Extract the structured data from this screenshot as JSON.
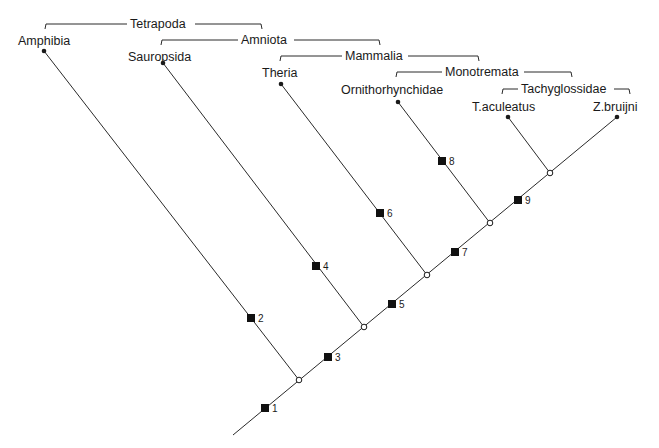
{
  "diagram": {
    "type": "cladogram",
    "taxa": [
      {
        "label": "Amphibia",
        "x": 44,
        "y": 51,
        "lx": 18,
        "ly": 45
      },
      {
        "label": "Sauropsida",
        "x": 163,
        "y": 63,
        "lx": 128,
        "ly": 61
      },
      {
        "label": "Theria",
        "x": 281,
        "y": 84,
        "lx": 262,
        "ly": 77
      },
      {
        "label": "Ornithorhynchidae",
        "x": 398,
        "y": 102,
        "lx": 341,
        "ly": 94
      },
      {
        "label": "T.aculeatus",
        "x": 508,
        "y": 117,
        "lx": 472,
        "ly": 111
      },
      {
        "label": "Z.bruijni",
        "x": 617,
        "y": 117,
        "lx": 593,
        "ly": 111
      }
    ],
    "clades": [
      {
        "label": "Tetrapoda",
        "x1": 45,
        "x2": 262,
        "y": 24,
        "lx": 130,
        "lw": 62
      },
      {
        "label": "Amniota",
        "x1": 161,
        "x2": 380,
        "y": 40,
        "lx": 241,
        "lw": 50
      },
      {
        "label": "Mammalia",
        "x1": 280,
        "x2": 479,
        "y": 56,
        "lx": 345,
        "lw": 60
      },
      {
        "label": "Monotremata",
        "x1": 396,
        "x2": 572,
        "y": 72,
        "lx": 445,
        "lw": 76
      },
      {
        "label": "Tachyglossidae",
        "x1": 502,
        "x2": 630,
        "y": 89,
        "lx": 521,
        "lw": 90
      }
    ],
    "nodes": [
      {
        "x": 299,
        "y": 380
      },
      {
        "x": 364,
        "y": 327
      },
      {
        "x": 427,
        "y": 275
      },
      {
        "x": 490,
        "y": 223
      },
      {
        "x": 550,
        "y": 173
      }
    ],
    "root": {
      "x": 233,
      "y": 435
    },
    "characters": [
      {
        "label": "1",
        "x": 265,
        "y": 408
      },
      {
        "label": "2",
        "x": 251,
        "y": 318
      },
      {
        "label": "3",
        "x": 328,
        "y": 357
      },
      {
        "label": "4",
        "x": 316,
        "y": 266
      },
      {
        "label": "5",
        "x": 392,
        "y": 304
      },
      {
        "label": "6",
        "x": 380,
        "y": 213
      },
      {
        "label": "7",
        "x": 455,
        "y": 252
      },
      {
        "label": "8",
        "x": 442,
        "y": 161
      },
      {
        "label": "9",
        "x": 518,
        "y": 200
      }
    ],
    "colors": {
      "line": "#2a2a2a",
      "text": "#1a1a1a",
      "background": "#ffffff"
    }
  }
}
